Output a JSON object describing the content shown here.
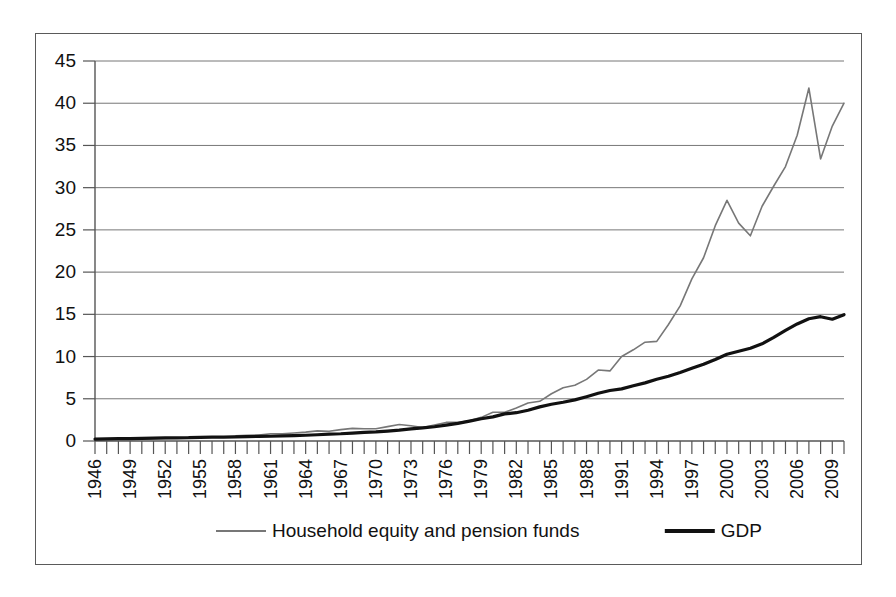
{
  "chart_data": {
    "type": "line",
    "title": "",
    "subtitle": "",
    "xlabel": "",
    "ylabel": "",
    "ylim": [
      0,
      45
    ],
    "ytick_step": 5,
    "ytick_labels": [
      "0",
      "5",
      "10",
      "15",
      "20",
      "25",
      "30",
      "35",
      "40",
      "45"
    ],
    "grid": true,
    "legend_position": "bottom",
    "xtick_labels": [
      "1946",
      "1949",
      "1952",
      "1955",
      "1958",
      "1961",
      "1964",
      "1967",
      "1970",
      "1973",
      "1976",
      "1979",
      "1982",
      "1985",
      "1988",
      "1991",
      "1994",
      "1997",
      "2000",
      "2003",
      "2006",
      "2009"
    ],
    "xtick_label_rotation": -90,
    "xlim": [
      1946,
      2010
    ],
    "x": [
      1946,
      1947,
      1948,
      1949,
      1950,
      1951,
      1952,
      1953,
      1954,
      1955,
      1956,
      1957,
      1958,
      1959,
      1960,
      1961,
      1962,
      1963,
      1964,
      1965,
      1966,
      1967,
      1968,
      1969,
      1970,
      1971,
      1972,
      1973,
      1974,
      1975,
      1976,
      1977,
      1978,
      1979,
      1980,
      1981,
      1982,
      1983,
      1984,
      1985,
      1986,
      1987,
      1988,
      1989,
      1990,
      1991,
      1992,
      1993,
      1994,
      1995,
      1996,
      1997,
      1998,
      1999,
      2000,
      2001,
      2002,
      2003,
      2004,
      2005,
      2006,
      2007,
      2008,
      2009,
      2010
    ],
    "series": [
      {
        "name": "Household equity and pension funds",
        "color": "#777777",
        "line_width": 1.6,
        "values": [
          0.15,
          0.17,
          0.18,
          0.2,
          0.23,
          0.27,
          0.3,
          0.32,
          0.4,
          0.46,
          0.5,
          0.5,
          0.62,
          0.68,
          0.7,
          0.85,
          0.85,
          0.95,
          1.05,
          1.2,
          1.15,
          1.35,
          1.5,
          1.45,
          1.45,
          1.7,
          1.95,
          1.8,
          1.6,
          1.9,
          2.2,
          2.2,
          2.4,
          2.8,
          3.4,
          3.4,
          3.9,
          4.5,
          4.7,
          5.6,
          6.3,
          6.6,
          7.3,
          8.4,
          8.3,
          10.0,
          10.8,
          11.7,
          11.8,
          13.8,
          16.0,
          19.2,
          21.7,
          25.5,
          28.5,
          25.8,
          24.3,
          27.8,
          30.2,
          32.5,
          36.2,
          41.8,
          33.4,
          37.3,
          40.0
        ]
      },
      {
        "name": "GDP",
        "color": "#111111",
        "line_width": 3.2,
        "values": [
          0.23,
          0.25,
          0.27,
          0.27,
          0.3,
          0.34,
          0.36,
          0.38,
          0.39,
          0.43,
          0.45,
          0.47,
          0.48,
          0.52,
          0.54,
          0.56,
          0.6,
          0.64,
          0.68,
          0.74,
          0.81,
          0.86,
          0.94,
          1.02,
          1.07,
          1.17,
          1.28,
          1.43,
          1.55,
          1.69,
          1.88,
          2.09,
          2.36,
          2.63,
          2.86,
          3.21,
          3.35,
          3.64,
          4.04,
          4.35,
          4.59,
          4.87,
          5.25,
          5.66,
          5.98,
          6.17,
          6.54,
          6.88,
          7.31,
          7.66,
          8.1,
          8.61,
          9.09,
          9.66,
          10.28,
          10.62,
          10.98,
          11.51,
          12.27,
          13.09,
          13.86,
          14.48,
          14.72,
          14.42,
          14.96
        ]
      }
    ],
    "legend": [
      {
        "label": "Household equity and pension funds",
        "color": "#777777",
        "line_width": 2
      },
      {
        "label": "GDP",
        "color": "#111111",
        "line_width": 4
      }
    ]
  },
  "frame": {
    "border_color": "#5a5a5a",
    "background": "#ffffff"
  }
}
